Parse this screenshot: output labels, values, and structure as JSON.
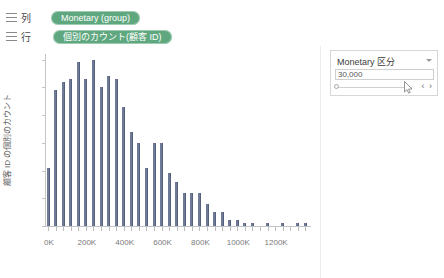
{
  "shelves": {
    "columns": {
      "label": "列",
      "icon": "columns-icon",
      "pill": "Monetary (group)"
    },
    "rows": {
      "label": "行",
      "icon": "rows-icon",
      "pill": "個別のカウント(顧客 ID)"
    },
    "pill_color": "#5fa87f"
  },
  "filter_card": {
    "title": "Monetary 区分",
    "caret_icon": "chevron-down-icon",
    "value": "30,000",
    "prev_label": "‹",
    "next_label": "›",
    "nav_arrows": "‹ ›",
    "slider_handle_icon": "slider-handle-icon",
    "cursor_icon": "mouse-pointer-icon"
  },
  "chart_data": {
    "type": "bar",
    "title": "",
    "xlabel": "Monetary (group)",
    "ylabel": "顧客 ID の個別のカウント",
    "xlim": [
      0,
      1400000
    ],
    "ylim": [
      0,
      62
    ],
    "yticks": [
      0,
      10,
      20,
      30,
      40,
      50,
      60
    ],
    "xticks": [
      0,
      200000,
      400000,
      600000,
      800000,
      1000000,
      1200000
    ],
    "xtick_labels": [
      "0K",
      "200K",
      "400K",
      "600K",
      "800K",
      "1000K",
      "1200K"
    ],
    "grid": false,
    "legend": false,
    "bar_color": "#6e7a96",
    "bin_width": 40000,
    "x": [
      0,
      40000,
      80000,
      120000,
      160000,
      200000,
      240000,
      280000,
      320000,
      360000,
      400000,
      440000,
      480000,
      520000,
      560000,
      600000,
      640000,
      680000,
      720000,
      760000,
      800000,
      840000,
      880000,
      920000,
      960000,
      1000000,
      1040000,
      1080000,
      1120000,
      1160000,
      1200000,
      1240000,
      1280000,
      1320000,
      1360000
    ],
    "categories": [
      "0K",
      "40K",
      "80K",
      "120K",
      "160K",
      "200K",
      "240K",
      "280K",
      "320K",
      "360K",
      "400K",
      "440K",
      "480K",
      "520K",
      "560K",
      "600K",
      "640K",
      "680K",
      "720K",
      "760K",
      "800K",
      "840K",
      "880K",
      "920K",
      "960K",
      "1000K",
      "1040K",
      "1080K",
      "1120K",
      "1160K",
      "1200K",
      "1240K",
      "1280K",
      "1320K",
      "1360K"
    ],
    "values": [
      21,
      49,
      52,
      53,
      59,
      53,
      60,
      50,
      54,
      53,
      43,
      34,
      30,
      21,
      30,
      30,
      19,
      16,
      12,
      12,
      12,
      8,
      5,
      5,
      2,
      2,
      1,
      1,
      0,
      1,
      0,
      1,
      0,
      1,
      1
    ]
  }
}
